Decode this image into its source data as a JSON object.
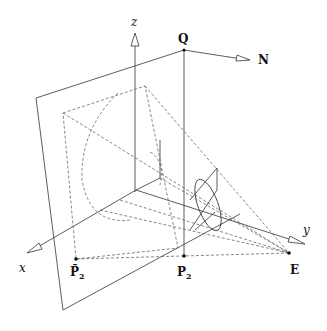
{
  "diagram": {
    "title": "",
    "axes": {
      "x_label": "x",
      "y_label": "y",
      "z_label": "z"
    },
    "points": {
      "Q": "Q",
      "N": "N",
      "E": "E",
      "P2": "P",
      "P2_sub": "2",
      "P2bar": "P̄",
      "P2bar_sub": "2"
    },
    "colors": {
      "line": "#333333",
      "dashed": "#555555",
      "background": "#ffffff"
    }
  }
}
